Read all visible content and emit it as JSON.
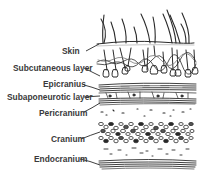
{
  "diagram": {
    "labels": [
      {
        "id": "skin",
        "text": "Skin"
      },
      {
        "id": "subcutaneous",
        "text": "Subcutaneous layer"
      },
      {
        "id": "epicranius",
        "text": "Epicranius"
      },
      {
        "id": "subaponeurotic",
        "text": "Subaponeurotic layer"
      },
      {
        "id": "pericranium",
        "text": "Pericranium"
      },
      {
        "id": "cranium",
        "text": "Cranium"
      },
      {
        "id": "endocranium",
        "text": "Endocranium"
      }
    ],
    "colors": {
      "ink": "#2a2a2a",
      "label": "#3a3a3a",
      "background": "#ffffff"
    }
  }
}
